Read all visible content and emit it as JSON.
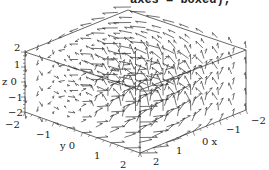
{
  "header": {
    "command_fragment": "axes = boxed);"
  },
  "chart_data": {
    "type": "fieldplot3d",
    "title": "",
    "axes_style": "boxed",
    "x": {
      "label": "x",
      "ticks": [
        "-2",
        "-1",
        "0",
        "1",
        "2"
      ],
      "range": [
        -2,
        2
      ]
    },
    "y": {
      "label": "y",
      "ticks": [
        "-2",
        "-1",
        "0",
        "1",
        "2"
      ],
      "range": [
        -2,
        2
      ]
    },
    "z": {
      "label": "z",
      "ticks": [
        "2",
        "1",
        "0",
        "-1",
        "-2"
      ],
      "range": [
        -2,
        2
      ]
    },
    "grid": false,
    "legend": null,
    "colors": {
      "arrows": "#333333",
      "frame": "#444444",
      "text": "#222222"
    }
  },
  "ticks": {
    "z": [
      {
        "t": "2",
        "x": 14,
        "y": 43
      },
      {
        "t": "1",
        "x": 14,
        "y": 60
      },
      {
        "t": "z 0",
        "x": 2,
        "y": 77
      },
      {
        "t": "−1",
        "x": 8,
        "y": 93
      },
      {
        "t": "−2",
        "x": 8,
        "y": 108
      }
    ],
    "y": [
      {
        "t": "−2",
        "x": 5,
        "y": 120
      },
      {
        "t": "−1",
        "x": 36,
        "y": 130
      },
      {
        "t": "y 0",
        "x": 60,
        "y": 141
      },
      {
        "t": "1",
        "x": 94,
        "y": 151
      },
      {
        "t": "2",
        "x": 120,
        "y": 160
      }
    ],
    "x": [
      {
        "t": "2",
        "x": 153,
        "y": 157
      },
      {
        "t": "1",
        "x": 176,
        "y": 146
      },
      {
        "t": "0 x",
        "x": 202,
        "y": 137
      },
      {
        "t": "−1",
        "x": 226,
        "y": 125
      },
      {
        "t": "−2",
        "x": 251,
        "y": 116
      }
    ]
  }
}
